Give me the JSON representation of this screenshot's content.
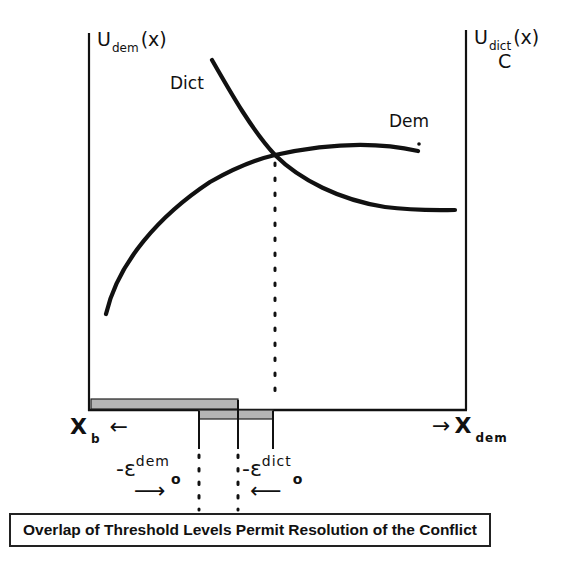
{
  "diagram": {
    "title": "",
    "left_axis": {
      "label_main": "U",
      "label_sub": "dem",
      "label_suffix": "(x)"
    },
    "right_axis": {
      "label_main": "U",
      "label_sub": "dict",
      "label_suffix": "(x)",
      "label_extra": "C"
    },
    "curves": [
      {
        "name": "Dict",
        "label": "Dict",
        "description": "decreasing curve from upper left to lower right"
      },
      {
        "name": "Dem",
        "label": "Dem",
        "description": "increasing concave curve from lower left to upper right"
      }
    ],
    "intersection": {
      "description": "equilibrium point where Dict and Dem curves cross; dotted vertical line drops to baseline"
    },
    "x_left": {
      "label_main": "X",
      "label_sub": "b",
      "arrow": "←"
    },
    "x_right": {
      "label_main": "X",
      "label_sub": "dem",
      "arrow": "→"
    },
    "thresholds": [
      {
        "name": "dem-threshold",
        "prefix": "-ε",
        "sup": "dem",
        "sub": "o",
        "arrow": "⟶"
      },
      {
        "name": "dict-threshold",
        "prefix": "-ε",
        "sup": "dict",
        "sub": "o",
        "arrow": "⟵"
      }
    ],
    "caption": "Overlap of Threshold Levels Permit Resolution of the Conflict",
    "colors": {
      "line": "#111111",
      "bar_fill": "#b5b5b5",
      "background": "#ffffff"
    }
  }
}
